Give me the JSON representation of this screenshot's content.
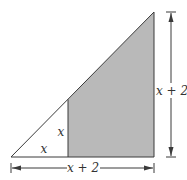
{
  "diagram": {
    "type": "geometry-right-triangle-with-shaded-trapezoid",
    "colors": {
      "stroke": "#3a3a3a",
      "shade": "#b9b9b9",
      "background": "#ffffff",
      "text": "#333333"
    },
    "labels": {
      "small_base": "x",
      "small_height": "x",
      "big_height": "x + 2",
      "big_base": "x + 2"
    },
    "geometry": {
      "outer_triangle": {
        "bottom_left": [
          11,
          157
        ],
        "top_right": [
          154,
          12
        ],
        "bottom_right": [
          154,
          157
        ]
      },
      "divider_x": 68,
      "divider_top_y": 99
    }
  }
}
